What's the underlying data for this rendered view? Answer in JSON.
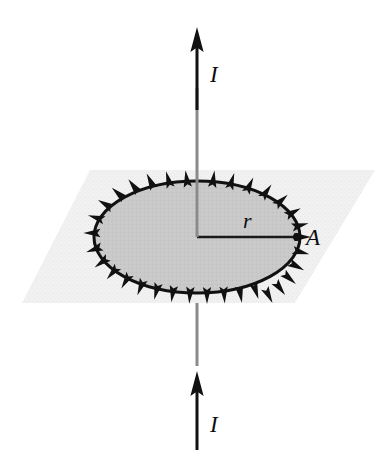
{
  "figure": {
    "type": "physics-diagram"
  },
  "labels": {
    "current_top": "I",
    "current_bottom": "I",
    "radius": "r",
    "point_a": "A"
  },
  "icons": {
    "arrow_top": "arrow-up-icon",
    "arrow_bottom": "arrow-up-icon",
    "loop_direction": "circulation-arrowhead-icon",
    "point_marker": "point-dot-icon"
  },
  "colors": {
    "wire": "#8a8a8a",
    "arrow": "#111111",
    "plane_fill": "#f1f1f1",
    "loop_fill": "#c9c9c9",
    "loop_stroke": "#111111",
    "radius_line": "#1a1a1a",
    "background": "#ffffff"
  },
  "geometry": {
    "plane": {
      "points": "90,170 375,170 295,303 22,303",
      "description": "parallelogram plane in perspective"
    },
    "loop": {
      "center_x": 197,
      "center_y": 237,
      "radius_x": 103,
      "radius_y": 56,
      "arrowhead_count": 24,
      "direction": "counterclockwise"
    },
    "wire": {
      "x": 197,
      "top_y": 88,
      "bottom_y": 366
    },
    "radius_line": {
      "from_x": 197,
      "from_y": 237,
      "to_x": 296,
      "to_y": 237
    },
    "arrow_top": {
      "x": 197,
      "tail_y": 110,
      "head_y": 30
    },
    "arrow_bottom": {
      "x": 197,
      "tail_y": 448,
      "head_y": 375
    }
  },
  "label_positions": {
    "current_top": {
      "x": 210,
      "y": 82
    },
    "current_bottom": {
      "x": 210,
      "y": 432
    },
    "radius": {
      "x": 243,
      "y": 228
    },
    "point_a": {
      "x": 306,
      "y": 245
    }
  }
}
